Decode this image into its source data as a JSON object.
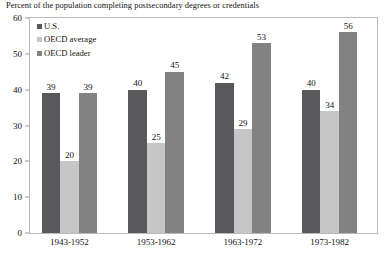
{
  "chart_data": {
    "type": "bar",
    "title": "Percent of the population completing postsecondary degrees or credentials",
    "xlabel": "",
    "ylabel": "",
    "ylim": [
      0,
      60
    ],
    "yticks": [
      0,
      10,
      20,
      30,
      40,
      50,
      60
    ],
    "grid": false,
    "legend_position": "top-left-inside",
    "categories": [
      "1943-1952",
      "1953-1962",
      "1963-1972",
      "1973-1982"
    ],
    "series": [
      {
        "name": "U.S.",
        "color": "#59595b",
        "values": [
          39,
          40,
          42,
          40
        ]
      },
      {
        "name": "OECD average",
        "color": "#c6c6c6",
        "values": [
          20,
          25,
          29,
          34
        ]
      },
      {
        "name": "OECD leader",
        "color": "#828282",
        "values": [
          39,
          45,
          53,
          56
        ]
      }
    ]
  },
  "axis": {
    "y_tick_labels": [
      "0",
      "10",
      "20",
      "30",
      "40",
      "50",
      "60"
    ]
  },
  "colors": {
    "us": "#59595b",
    "oecd_average": "#c6c6c6",
    "oecd_leader": "#828282",
    "frame": "#b9b9b9",
    "text": "#111111",
    "background": "#ffffff"
  }
}
